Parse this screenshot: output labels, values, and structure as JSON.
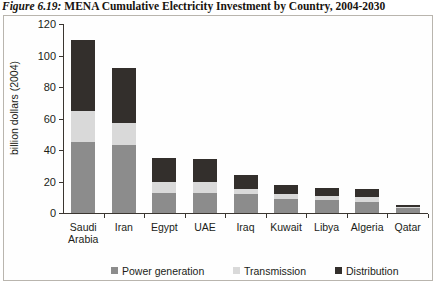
{
  "figure": {
    "caption_lead": "Figure 6.19:",
    "caption_rest": " MENA Cumulative Electricity Investment by Country, 2004-2030"
  },
  "colors": {
    "power_generation": "#8c8c8c",
    "transmission": "#d9d9d9",
    "distribution": "#332f2c",
    "axis": "#3a3530",
    "frame": "#b9b5ae",
    "text": "#211d18",
    "background": "#fefefe"
  },
  "chart_data": {
    "type": "bar",
    "stacked": true,
    "title": "MENA Cumulative Electricity Investment by Country, 2004-2030",
    "xlabel": "",
    "ylabel": "billion dollars (2004)",
    "ylim": [
      0,
      120
    ],
    "yticks": [
      0,
      20,
      40,
      60,
      80,
      100,
      120
    ],
    "ytick_labels": [
      "0",
      "20",
      "40",
      "60",
      "80",
      "100",
      "120"
    ],
    "grid": false,
    "legend_position": "bottom",
    "categories": [
      "Saudi Arabia",
      "Iran",
      "Egypt",
      "UAE",
      "Iraq",
      "Kuwait",
      "Libya",
      "Algeria",
      "Qatar"
    ],
    "category_lines": [
      [
        "Saudi",
        "Arabia"
      ],
      [
        "Iran"
      ],
      [
        "Egypt"
      ],
      [
        "UAE"
      ],
      [
        "Iraq"
      ],
      [
        "Kuwait"
      ],
      [
        "Libya"
      ],
      [
        "Algeria"
      ],
      [
        "Qatar"
      ]
    ],
    "series": [
      {
        "name": "Power generation",
        "color": "#8c8c8c",
        "values": [
          45,
          43,
          13,
          13,
          12,
          9,
          8,
          7,
          3
        ]
      },
      {
        "name": "Transmission",
        "color": "#d9d9d9",
        "values": [
          20,
          14,
          7,
          7,
          3,
          3,
          3,
          3,
          1
        ]
      },
      {
        "name": "Distribution",
        "color": "#332f2c",
        "values": [
          45,
          35,
          15,
          14,
          9,
          6,
          5,
          5,
          1
        ]
      }
    ],
    "totals": [
      110,
      92,
      35,
      34,
      24,
      18,
      16,
      15,
      5
    ]
  },
  "legend": {
    "items": [
      {
        "label": "Power generation",
        "color": "#8c8c8c"
      },
      {
        "label": "Transmission",
        "color": "#d9d9d9"
      },
      {
        "label": "Distribution",
        "color": "#332f2c"
      }
    ]
  }
}
